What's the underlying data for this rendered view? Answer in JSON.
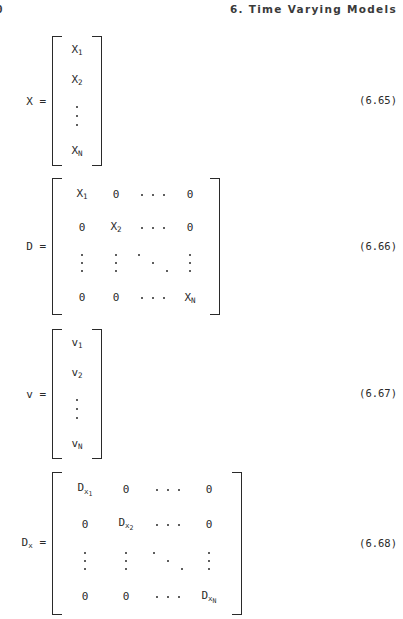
{
  "header": {
    "folio": "0",
    "chapter_title": "6.  Time Varying Models"
  },
  "equations": [
    {
      "id": "eq-6-65",
      "label": "X",
      "label_sub": "",
      "equals": "=",
      "number": "(6.65)",
      "kind": "column-vector",
      "top": 36,
      "height": 130,
      "entries": [
        "X",
        "X",
        "X"
      ],
      "subs": [
        "1",
        "2",
        "N"
      ]
    },
    {
      "id": "eq-6-66",
      "label": "D",
      "label_sub": "",
      "equals": "=",
      "number": "(6.66)",
      "kind": "diagonal-matrix",
      "top": 178,
      "height": 137,
      "diag": [
        "X",
        "X",
        "X"
      ],
      "diag_subs": [
        "1",
        "2",
        "N"
      ],
      "zero": "0"
    },
    {
      "id": "eq-6-67",
      "label": "v",
      "label_sub": "",
      "equals": "=",
      "number": "(6.67)",
      "kind": "column-vector",
      "top": 329,
      "height": 130,
      "entries": [
        "v",
        "v",
        "v"
      ],
      "subs": [
        "1",
        "2",
        "N"
      ]
    },
    {
      "id": "eq-6-68",
      "label": "D",
      "label_sub": "x",
      "equals": "=",
      "number": "(6.68)",
      "kind": "diagonal-matrix-nested",
      "top": 472,
      "height": 143,
      "diag": [
        "D",
        "D",
        "D"
      ],
      "diag_subs": [
        "x",
        "x",
        "x"
      ],
      "diag_subs2": [
        "1",
        "2",
        "N"
      ],
      "zero": "0"
    }
  ],
  "colors": {
    "page_background": "#ffffff",
    "ink": "#2a2a2a",
    "header_ink": "#3a3a3a"
  }
}
